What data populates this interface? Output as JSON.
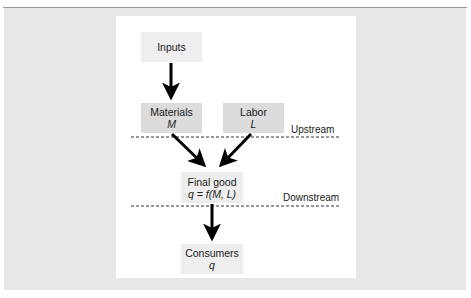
{
  "diagram": {
    "nodes": {
      "inputs": {
        "label": "Inputs"
      },
      "materials": {
        "label": "Materials",
        "symbol": "M"
      },
      "labor": {
        "label": "Labor",
        "symbol": "L"
      },
      "final_good": {
        "label": "Final good",
        "formula": "q = f(M, L)"
      },
      "consumers": {
        "label": "Consumers",
        "symbol": "q"
      }
    },
    "edges": [
      {
        "from": "inputs",
        "to": "materials"
      },
      {
        "from": "materials",
        "to": "final_good"
      },
      {
        "from": "labor",
        "to": "final_good"
      },
      {
        "from": "final_good",
        "to": "consumers"
      }
    ],
    "boundaries": {
      "upstream": "Upstream",
      "downstream": "Downstream"
    },
    "colors": {
      "outer_background": "#e7e7e7",
      "panel_background": "#ffffff",
      "input_box": "#eeeeee",
      "node_box": "#dcdcdc",
      "arrow": "#000000"
    }
  }
}
